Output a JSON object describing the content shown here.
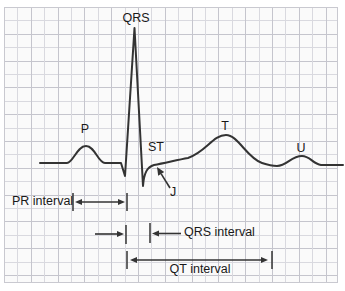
{
  "figure": {
    "type": "ecg-waveform-diagram",
    "paper_color": "#fafafa",
    "grid_color_light": "#d9d9df",
    "grid_color_dark": "#c5c5cd",
    "trace_color": "#333333",
    "label_color": "#191919"
  },
  "labels": {
    "qrs": "QRS",
    "p": "P",
    "st": "ST",
    "j": "J",
    "t": "T",
    "u": "U",
    "pr_interval": "PR interval",
    "qrs_interval": "QRS interval",
    "qt_interval": "QT interval"
  }
}
